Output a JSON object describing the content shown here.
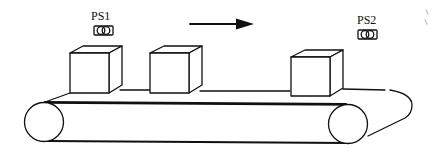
{
  "diagram": {
    "type": "conveyor-belt",
    "sensors": [
      {
        "label": "PS1",
        "icon": "photo-sensor-icon"
      },
      {
        "label": "PS2",
        "icon": "photo-sensor-icon"
      }
    ],
    "direction": {
      "icon": "arrow-right-icon",
      "meaning": "left-to-right"
    },
    "boxes": [
      {
        "name": "box-1"
      },
      {
        "name": "box-2"
      },
      {
        "name": "box-3"
      }
    ],
    "rollers": [
      {
        "name": "left-roller"
      },
      {
        "name": "right-roller"
      }
    ],
    "colors": {
      "stroke": "#111111",
      "background": "#ffffff"
    }
  }
}
